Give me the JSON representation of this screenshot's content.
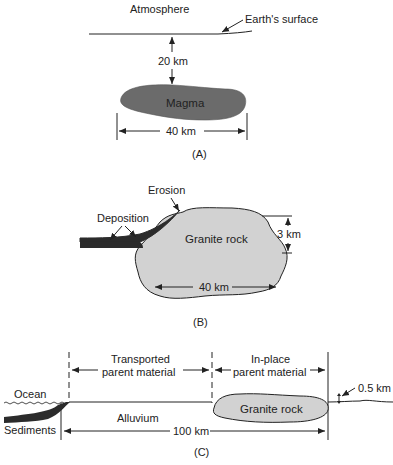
{
  "panels": {
    "A": {
      "caption": "(A)",
      "atmosphere_label": "Atmosphere",
      "surface_label": "Earth's surface",
      "depth_label": "20 km",
      "magma_label": "Magma",
      "width_label": "40 km"
    },
    "B": {
      "caption": "(B)",
      "erosion_label": "Erosion",
      "deposition_label": "Deposition",
      "rock_label": "Granite rock",
      "height_label": "3 km",
      "width_label": "40 km"
    },
    "C": {
      "caption": "(C)",
      "transported_line1": "Transported",
      "transported_line2": "parent material",
      "inplace_line1": "In-place",
      "inplace_line2": "parent material",
      "ocean_label": "Ocean",
      "sediments_label": "Sediments",
      "alluvium_label": "Alluvium",
      "rock_label": "Granite rock",
      "relief_label": "0.5 km",
      "distance_label": "100 km"
    }
  },
  "colors": {
    "magma": "#6b6b6b",
    "granite": "#d2d2d2",
    "sediment": "#2b2b2b",
    "line": "#222222"
  }
}
